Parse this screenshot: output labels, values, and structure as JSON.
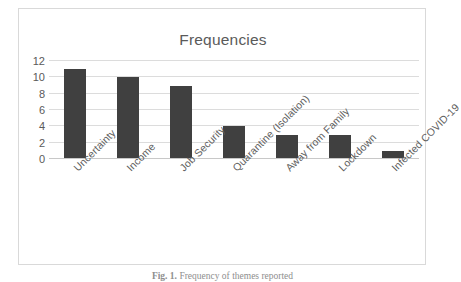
{
  "chart_data": {
    "type": "bar",
    "title": "Frequencies",
    "xlabel": "",
    "ylabel": "",
    "categories": [
      "Uncertainty",
      "Income",
      "Job Security",
      "Quarantine (Isolation)",
      "Away from Family",
      "Lockdown",
      "Infected COVID-19"
    ],
    "values": [
      11,
      10,
      9,
      4,
      3,
      3,
      1
    ],
    "ylim": [
      0,
      12
    ],
    "yticks": [
      0,
      2,
      4,
      6,
      8,
      10,
      12
    ],
    "ytick_labels": [
      "0",
      "2",
      "4",
      "6",
      "8",
      "10",
      "12"
    ],
    "grid": "horizontal",
    "legend": "none",
    "bar_color": "#404040",
    "gridline_color": "#dcdcdc",
    "title_color": "#5a5a5a",
    "axis_text_color": "#5a5a5a"
  },
  "caption": {
    "figure_number": "Fig. 1.",
    "text": "Frequency of themes reported"
  }
}
